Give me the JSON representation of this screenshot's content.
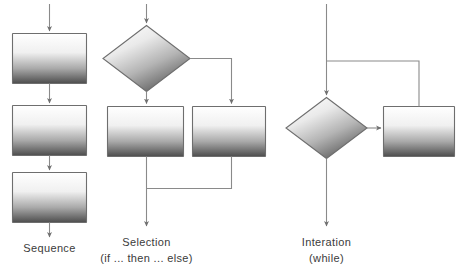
{
  "diagram": {
    "background_color": "#ffffff",
    "line_color": "#8a8a8a",
    "shape_border_color": "#6e6e6e",
    "shape_gradient_light": "#ffffff",
    "shape_gradient_dark": "#4d4d4d",
    "diamond_gradient_light": "#f2f2f2",
    "diamond_gradient_dark": "#5a5a5a",
    "text_color": "#3b3b3b"
  },
  "columns": [
    {
      "id": "sequence",
      "caption_line1": "Sequence",
      "caption_line2": "",
      "nodes": [
        {
          "name": "sequence-process-1",
          "shape": "process"
        },
        {
          "name": "sequence-process-2",
          "shape": "process"
        },
        {
          "name": "sequence-process-3",
          "shape": "process"
        }
      ]
    },
    {
      "id": "selection",
      "caption_line1": "Selection",
      "caption_line2": "(if ... then ... else)",
      "nodes": [
        {
          "name": "selection-decision",
          "shape": "decision"
        },
        {
          "name": "selection-then-process",
          "shape": "process"
        },
        {
          "name": "selection-else-process",
          "shape": "process"
        }
      ]
    },
    {
      "id": "iteration",
      "caption_line1": "Interation",
      "caption_line2": "(while)",
      "nodes": [
        {
          "name": "iteration-decision",
          "shape": "decision"
        },
        {
          "name": "iteration-body-process",
          "shape": "process"
        }
      ]
    }
  ]
}
